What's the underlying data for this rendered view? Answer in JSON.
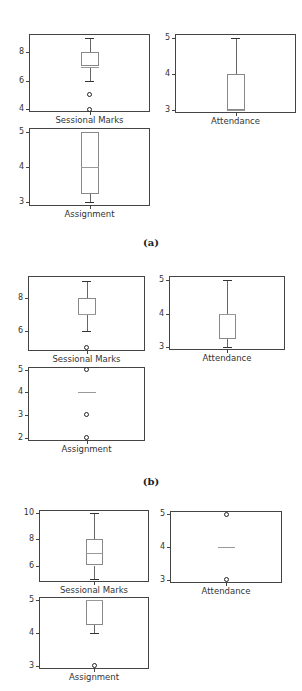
{
  "figure_groups": [
    {
      "caption": "(a)"
    },
    {
      "caption": "(b)"
    },
    {
      "caption": null
    }
  ],
  "chart_data": [
    {
      "group": "(a)",
      "type": "boxplot",
      "panels": [
        {
          "xlabel": "Sessional Marks",
          "yticks": [
            4,
            6,
            8
          ],
          "ylim": [
            3.8,
            9.3
          ],
          "whisker_low": 6,
          "q1": 7,
          "median": 7,
          "q3": 8,
          "whisker_high": 9,
          "fliers": [
            5,
            4
          ]
        },
        {
          "xlabel": "Attendance",
          "yticks": [
            3,
            4,
            5
          ],
          "ylim": [
            2.92,
            5.12
          ],
          "whisker_low": 3,
          "q1": 3,
          "median": 3,
          "q3": 4,
          "whisker_high": 5,
          "fliers": []
        },
        {
          "xlabel": "Assignment",
          "yticks": [
            3,
            4,
            5
          ],
          "ylim": [
            2.9,
            5.1
          ],
          "whisker_low": 3,
          "q1": 3.25,
          "median": 4,
          "q3": 5,
          "whisker_high": 5,
          "fliers": []
        }
      ]
    },
    {
      "group": "(b)",
      "type": "boxplot",
      "panels": [
        {
          "xlabel": "Sessional Marks",
          "yticks": [
            6,
            8
          ],
          "ylim": [
            4.8,
            9.3
          ],
          "whisker_low": 6,
          "q1": 7,
          "median": 7,
          "q3": 8,
          "whisker_high": 9,
          "fliers": [
            5
          ]
        },
        {
          "xlabel": "Attendance",
          "yticks": [
            3,
            4,
            5
          ],
          "ylim": [
            2.92,
            5.12
          ],
          "whisker_low": 3,
          "q1": 3.25,
          "median": 4,
          "q3": 4,
          "whisker_high": 5,
          "fliers": []
        },
        {
          "xlabel": "Assignment",
          "yticks": [
            2,
            3,
            4,
            5
          ],
          "ylim": [
            1.85,
            5.12
          ],
          "whisker_low": 4,
          "q1": 4,
          "median": 4,
          "q3": 4,
          "whisker_high": 4,
          "fliers": [
            5,
            3,
            2
          ]
        }
      ]
    },
    {
      "group": "(c)",
      "type": "boxplot",
      "panels": [
        {
          "xlabel": "Sessional Marks",
          "yticks": [
            6,
            8,
            10
          ],
          "ylim": [
            4.75,
            10.25
          ],
          "whisker_low": 5,
          "q1": 6,
          "median": 7,
          "q3": 8,
          "whisker_high": 10,
          "fliers": []
        },
        {
          "xlabel": "Attendance",
          "yticks": [
            3,
            4,
            5
          ],
          "ylim": [
            2.9,
            5.1
          ],
          "whisker_low": 4,
          "q1": 4,
          "median": 4,
          "q3": 4,
          "whisker_high": 4,
          "fliers": [
            5,
            3
          ]
        },
        {
          "xlabel": "Assignment",
          "yticks": [
            3,
            4,
            5
          ],
          "ylim": [
            2.9,
            5.1
          ],
          "whisker_low": 4,
          "q1": 4.25,
          "median": 5,
          "q3": 5,
          "whisker_high": 5,
          "fliers": [
            3
          ]
        }
      ]
    }
  ]
}
